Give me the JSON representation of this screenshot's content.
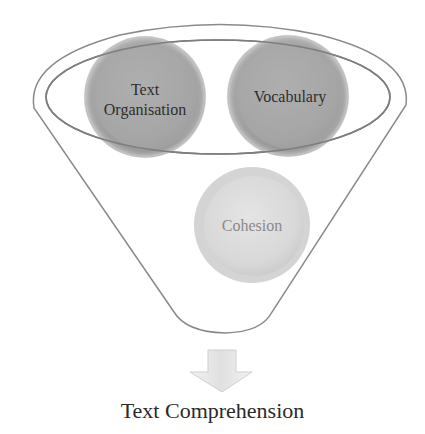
{
  "diagram": {
    "type": "funnel",
    "inputs": [
      {
        "label_lines": [
          "Text",
          "Organisation"
        ],
        "color": "#a9a9a9"
      },
      {
        "label_lines": [
          "Vocabulary"
        ],
        "color": "#a9a9a9"
      },
      {
        "label_lines": [
          "Cohesion"
        ],
        "color": "#dcdcdc"
      }
    ],
    "output": {
      "label": "Text Comprehension"
    },
    "colors": {
      "funnel_stroke": "#8a8a8a",
      "arrow_fill": "#e6e6e6",
      "text": "#2a2a2a",
      "cohesion_text": "#8a8a8a"
    }
  }
}
